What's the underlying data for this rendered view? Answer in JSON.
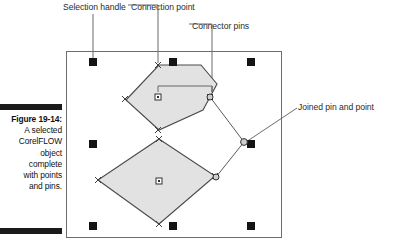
{
  "figure": {
    "caption_label": "Figure 19-14:",
    "caption_lines": [
      "A selected",
      "CorelFLOW",
      "object",
      "complete",
      "with points",
      "and pins."
    ]
  },
  "callouts": [
    {
      "id": "selection-handle",
      "label": "Selection handle"
    },
    {
      "id": "connection-point",
      "label": "Connection point"
    },
    {
      "id": "connector-pins",
      "label": "Connector pins"
    },
    {
      "id": "joined-pin-point",
      "label": "Joined pin and point"
    }
  ],
  "canvas": {
    "frame": {
      "x": 66,
      "y": 51,
      "width": 216,
      "height": 187
    },
    "colors": {
      "frame_stroke": "#6e6e6e",
      "shape_fill": "#e2e2e2",
      "shape_stroke": "#4a4a4a",
      "handle_fill": "#141414",
      "marker_stroke": "#3c3c3c",
      "leader_stroke": "#5a5a5a",
      "rule_fill": "#1a1a1a"
    },
    "selection_handles": [
      {
        "cx": 93,
        "cy": 62
      },
      {
        "cx": 173,
        "cy": 62
      },
      {
        "cx": 251,
        "cy": 62
      },
      {
        "cx": 93,
        "cy": 144
      },
      {
        "cx": 251,
        "cy": 144
      },
      {
        "cx": 93,
        "cy": 226
      },
      {
        "cx": 173,
        "cy": 226
      },
      {
        "cx": 251,
        "cy": 226
      }
    ],
    "hexagon": {
      "points": "126,100 159,65 201,65 217,84 203,110 159,130 126,100",
      "center_point": {
        "cx": 158,
        "cy": 97
      },
      "connection_points": [
        {
          "cx": 158,
          "cy": 65
        },
        {
          "cx": 158,
          "cy": 130
        },
        {
          "cx": 125,
          "cy": 99
        },
        {
          "cx": 210,
          "cy": 97
        }
      ]
    },
    "diamond": {
      "points": "159,139 215,176 159,224 98,180 159,139",
      "center_point": {
        "cx": 159,
        "cy": 181
      },
      "connection_points": [
        {
          "cx": 159,
          "cy": 139
        },
        {
          "cx": 215,
          "cy": 176
        },
        {
          "cx": 159,
          "cy": 224
        },
        {
          "cx": 98,
          "cy": 180
        }
      ]
    },
    "connector_line": {
      "path": "M 210,97 L 244,142 L 216,177"
    },
    "connector_pins": [
      {
        "cx": 210,
        "cy": 97
      },
      {
        "cx": 244,
        "cy": 142
      },
      {
        "cx": 216,
        "cy": 177
      }
    ],
    "joined_pin_and_point": {
      "cx": 244,
      "cy": 142
    }
  }
}
